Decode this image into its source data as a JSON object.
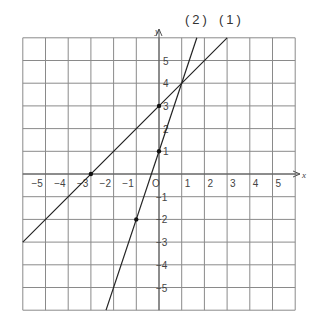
{
  "chart_data": {
    "type": "line",
    "title": "",
    "xlabel": "x",
    "ylabel": "y",
    "xlim": [
      -6,
      6
    ],
    "ylim": [
      -6,
      6
    ],
    "grid": true,
    "x_ticks": [
      "-5",
      "-4",
      "-3",
      "-2",
      "-1",
      "0",
      "1",
      "2",
      "3",
      "4",
      "5"
    ],
    "y_ticks": [
      "5",
      "4",
      "3",
      "2",
      "1",
      "-1",
      "-2",
      "-3",
      "-4",
      "-5"
    ],
    "origin_label": "O",
    "series": [
      {
        "name": "(1)",
        "equation": "y = x + 3",
        "slope": 1,
        "intercept": 3,
        "x_range": [
          -6,
          3
        ],
        "marked_points": [
          [
            -3,
            0
          ],
          [
            0,
            3
          ]
        ]
      },
      {
        "name": "(2)",
        "equation": "y = 3x + 1",
        "slope": 3,
        "intercept": 1,
        "x_range": [
          -2.333,
          1.667
        ],
        "marked_points": [
          [
            0,
            1
          ],
          [
            -1,
            -2
          ]
        ]
      }
    ],
    "intersection": [
      1,
      4
    ],
    "annotations": [
      "(2)",
      "(1)"
    ]
  },
  "labels": {
    "line1": "(1)",
    "line2": "(2)",
    "x_axis": "x",
    "y_axis": "y",
    "origin": "O"
  }
}
